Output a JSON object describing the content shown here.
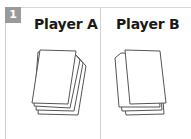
{
  "step": {
    "number": "1"
  },
  "players": [
    {
      "label": "Player A",
      "icon": "card-stack-icon"
    },
    {
      "label": "Player B",
      "icon": "card-stack-icon"
    }
  ],
  "colors": {
    "badge": "#9a9a9a",
    "border": "#d0d0d0",
    "stroke": "#555555"
  }
}
